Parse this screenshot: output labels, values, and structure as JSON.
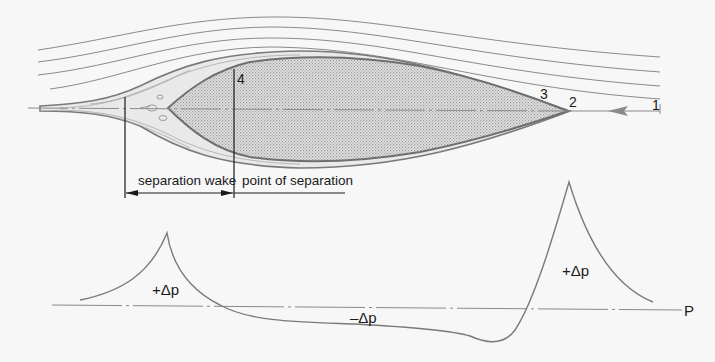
{
  "figure": {
    "colors": {
      "background": "#f7f7f7",
      "line": "#7a7a7a",
      "dark_line": "#1a1a1a",
      "body_fill": "#d6d6d6",
      "boundary_layer_fill": "#e6e6e6"
    }
  },
  "flow": {
    "point_labels": {
      "p1": "1",
      "p2": "2",
      "p3": "3",
      "p4": "4"
    },
    "streamline_count": 4,
    "flow_direction": "right-to-left"
  },
  "annotations": {
    "separation_wake": "separation wake",
    "point_of_separation": "point of separation"
  },
  "pressure": {
    "left_peak_label": "+Δp",
    "suction_label": "–Δp",
    "right_peak_label": "+Δp",
    "axis_label": "P"
  }
}
